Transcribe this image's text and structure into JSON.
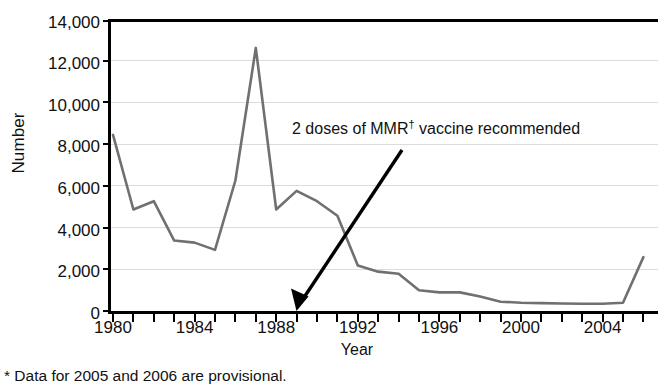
{
  "chart_data": {
    "type": "line",
    "title": "",
    "xlabel": "Year",
    "ylabel": "Number",
    "xlim": [
      1980,
      2006
    ],
    "ylim": [
      0,
      14000
    ],
    "grid": true,
    "legend": "none",
    "line_color": "#707070",
    "axis_color": "#000000",
    "grid_color": "#dcdcdc",
    "y_ticks": [
      0,
      2000,
      4000,
      6000,
      8000,
      10000,
      12000,
      14000
    ],
    "y_tick_labels": [
      "0",
      "2,000",
      "4,000",
      "6,000",
      "8,000",
      "10,000",
      "12,000",
      "14,000"
    ],
    "x_ticks": [
      1980,
      1981,
      1982,
      1983,
      1984,
      1985,
      1986,
      1987,
      1988,
      1989,
      1990,
      1991,
      1992,
      1993,
      1994,
      1995,
      1996,
      1997,
      1998,
      1999,
      2000,
      2001,
      2002,
      2003,
      2004,
      2005,
      2006
    ],
    "x_tick_labels": [
      "1980",
      "1984",
      "1988",
      "1992",
      "1996",
      "2000",
      "2004"
    ],
    "x_labeled_ticks": [
      1980,
      1984,
      1988,
      1992,
      1996,
      2000,
      2004
    ],
    "x": [
      1980,
      1981,
      1982,
      1983,
      1984,
      1985,
      1986,
      1987,
      1988,
      1989,
      1990,
      1991,
      1992,
      1993,
      1994,
      1995,
      1996,
      1997,
      1998,
      1999,
      2000,
      2001,
      2002,
      2003,
      2004,
      2005,
      2006
    ],
    "values": [
      8500,
      4900,
      5300,
      3400,
      3300,
      2950,
      6300,
      12700,
      4900,
      5800,
      5300,
      4600,
      2200,
      1900,
      1800,
      1000,
      900,
      900,
      700,
      450,
      400,
      380,
      360,
      350,
      350,
      400,
      2600
    ],
    "series": [
      {
        "name": "Number of reported cases",
        "values": [
          8500,
          4900,
          5300,
          3400,
          3300,
          2950,
          6300,
          12700,
          4900,
          5800,
          5300,
          4600,
          2200,
          1900,
          1800,
          1000,
          900,
          900,
          700,
          450,
          400,
          380,
          360,
          350,
          350,
          400,
          2600
        ]
      }
    ],
    "annotations": [
      {
        "text_prefix": "2 doses of MMR",
        "text_superscript": "†",
        "text_suffix": " vaccine recommended",
        "full_text": "2 doses of MMR† vaccine recommended",
        "points_to_year": 1989,
        "points_to_value": 0
      }
    ],
    "footnote": "* Data for 2005 and 2006 are provisional."
  }
}
